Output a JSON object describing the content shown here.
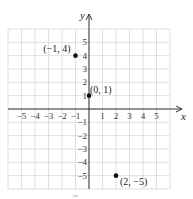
{
  "chart_data": {
    "type": "scatter",
    "title": "",
    "xlabel": "x",
    "ylabel": "y",
    "xlim": [
      -6,
      6
    ],
    "ylim": [
      -6,
      6
    ],
    "grid": true,
    "x_ticks": [
      -5,
      -4,
      -3,
      -2,
      -1,
      1,
      2,
      3,
      4,
      5
    ],
    "y_ticks": [
      -5,
      -4,
      -3,
      -2,
      -1,
      1,
      2,
      3,
      4,
      5
    ],
    "x_tick_labels": [
      "−5",
      "−4",
      "−3",
      "−2",
      "−1",
      "1",
      "2",
      "3",
      "4",
      "5"
    ],
    "y_tick_labels": [
      "−5",
      "−4",
      "−3",
      "−2",
      "−1",
      "1",
      "2",
      "3",
      "4",
      "5"
    ],
    "points": [
      {
        "x": -1,
        "y": 4,
        "label": "(−1, 4)"
      },
      {
        "x": 0,
        "y": 1,
        "label": "(0, 1)"
      },
      {
        "x": 2,
        "y": -5,
        "label": "(2, −5)"
      }
    ],
    "colors": {
      "grid": "#d8d8d8",
      "axis": "#333333",
      "point": "#111111"
    }
  }
}
